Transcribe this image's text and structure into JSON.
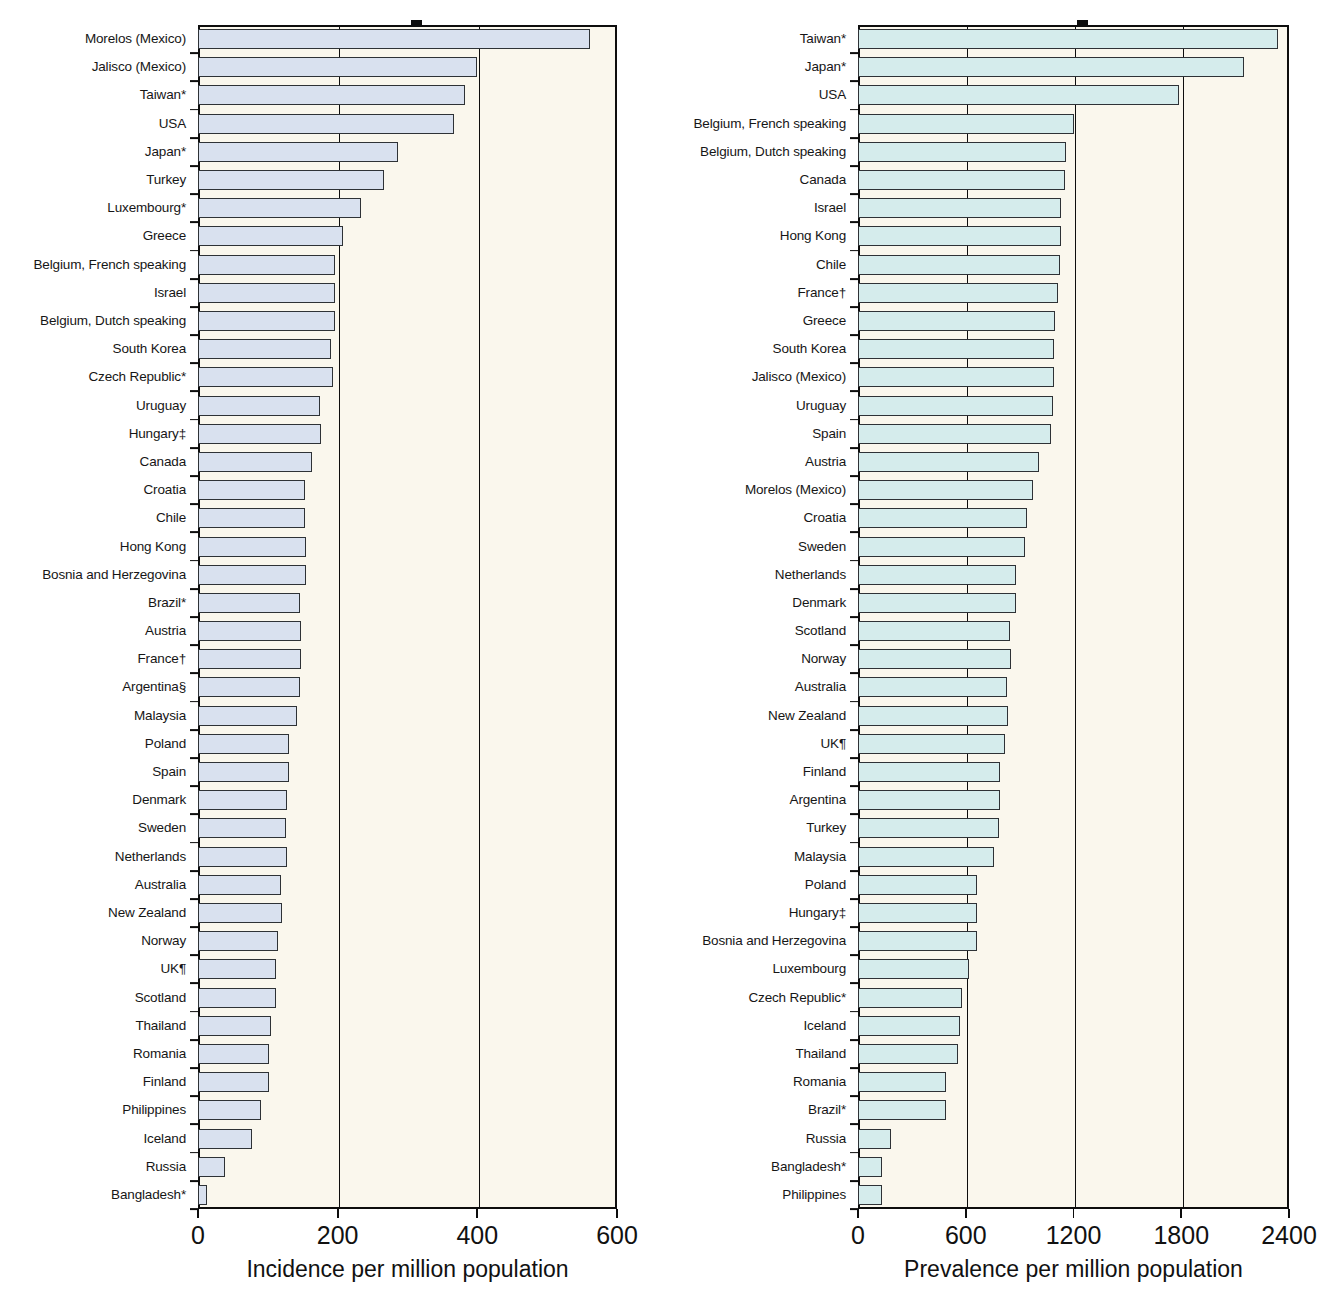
{
  "figure": {
    "background_color": "#ffffff",
    "plot_background_color": "#faf7ed",
    "axis_color": "#0d0d0d"
  },
  "chart_data": [
    {
      "type": "bar",
      "orientation": "horizontal",
      "panel": "left",
      "title": "",
      "xlabel": "Incidence per million population",
      "ylabel": "",
      "xlim": [
        0,
        600
      ],
      "xticks": [
        0,
        200,
        400,
        600
      ],
      "xtick_labels": [
        "0",
        "200",
        "400",
        "600"
      ],
      "grid": "vertical",
      "legend": "none",
      "bar_fill_color": "#d9e1ef",
      "bar_edge_color": "#2e3236",
      "categories": [
        "Morelos (Mexico)",
        "Jalisco (Mexico)",
        "Taiwan*",
        "USA",
        "Japan*",
        "Turkey",
        "Luxembourg*",
        "Greece",
        "Belgium, French speaking",
        "Israel",
        "Belgium, Dutch speaking",
        "South Korea",
        "Czech Republic*",
        "Uruguay",
        "Hungary‡",
        "Canada",
        "Croatia",
        "Chile",
        "Hong Kong",
        "Bosnia and Herzegovina",
        "Brazil*",
        "Austria",
        "France†",
        "Argentina§",
        "Malaysia",
        "Poland",
        "Spain",
        "Denmark",
        "Sweden",
        "Netherlands",
        "Australia",
        "New Zealand",
        "Norway",
        "UK¶",
        "Scotland",
        "Thailand",
        "Romania",
        "Finland",
        "Philippines",
        "Iceland",
        "Russia",
        "Bangladesh*"
      ],
      "values": [
        561,
        400,
        383,
        367,
        287,
        267,
        233,
        208,
        196,
        196,
        196,
        191,
        194,
        175,
        176,
        163,
        153,
        153,
        154,
        155,
        146,
        147,
        147,
        146,
        142,
        131,
        130,
        127,
        126,
        127,
        119,
        120,
        115,
        111,
        112,
        104,
        101,
        102,
        90,
        77,
        39,
        13
      ]
    },
    {
      "type": "bar",
      "orientation": "horizontal",
      "panel": "right",
      "title": "",
      "xlabel": "Prevalence per million population",
      "ylabel": "",
      "xlim": [
        0,
        2400
      ],
      "xticks": [
        0,
        600,
        1200,
        1800,
        2400
      ],
      "xtick_labels": [
        "0",
        "600",
        "1200",
        "1800",
        "2400"
      ],
      "grid": "vertical",
      "legend": "none",
      "bar_fill_color": "#d5ecec",
      "bar_edge_color": "#2e3236",
      "categories": [
        "Taiwan*",
        "Japan*",
        "USA",
        "Belgium, French speaking",
        "Belgium, Dutch speaking",
        "Canada",
        "Israel",
        "Hong Kong",
        "Chile",
        "France†",
        "Greece",
        "South Korea",
        "Jalisco (Mexico)",
        "Uruguay",
        "Spain",
        "Austria",
        "Morelos (Mexico)",
        "Croatia",
        "Sweden",
        "Netherlands",
        "Denmark",
        "Scotland",
        "Norway",
        "Australia",
        "New Zealand",
        "UK¶",
        "Finland",
        "Argentina",
        "Turkey",
        "Malaysia",
        "Poland",
        "Hungary‡",
        "Bosnia and Herzegovina",
        "Luxembourg",
        "Czech Republic*",
        "Iceland",
        "Thailand",
        "Romania",
        "Brazil*",
        "Russia",
        "Bangladesh*",
        "Philippines"
      ],
      "values": [
        2340,
        2152,
        1790,
        1200,
        1160,
        1155,
        1130,
        1128,
        1125,
        1115,
        1095,
        1092,
        1090,
        1085,
        1075,
        1010,
        975,
        940,
        930,
        880,
        880,
        845,
        850,
        830,
        835,
        820,
        790,
        790,
        785,
        760,
        660,
        660,
        660,
        620,
        578,
        570,
        555,
        490,
        490,
        185,
        132,
        135
      ]
    }
  ],
  "axis_left": {
    "tick_labels": [
      "0",
      "200",
      "400",
      "600"
    ],
    "axis_title": "Incidence per million population"
  },
  "axis_right": {
    "tick_labels": [
      "0",
      "600",
      "1200",
      "1800",
      "2400"
    ],
    "axis_title": "Prevalence per million population"
  }
}
